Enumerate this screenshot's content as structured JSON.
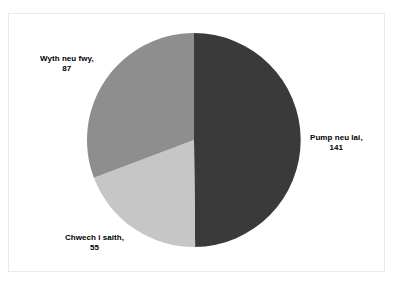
{
  "chart_data": {
    "type": "pie",
    "title": "",
    "subtitle": "",
    "xlabel": "",
    "ylabel": "",
    "legend_position": "none",
    "grid": false,
    "labels_on_slices": true,
    "label_format": "name, value",
    "total": 283,
    "start_angle_deg": 0,
    "direction": "clockwise",
    "categories": [
      "Pump neu lai",
      "Chwech i saith",
      "Wyth neu fwy"
    ],
    "values": [
      141,
      55,
      87
    ],
    "slices": [
      {
        "name": "Pump neu lai",
        "value": 141,
        "label_name": "Pump neu lai,",
        "label_value": "141",
        "color": "#3a3a3a",
        "start_deg": 0,
        "sweep_deg": 179.4,
        "percent": 49.8
      },
      {
        "name": "Chwech i saith",
        "value": 55,
        "label_name": "Chwech i saith,",
        "label_value": "55",
        "color": "#c6c6c6",
        "start_deg": 179.4,
        "sweep_deg": 69.9,
        "percent": 19.4
      },
      {
        "name": "Wyth neu fwy",
        "value": 87,
        "label_name": "Wyth neu fwy,",
        "label_value": "87",
        "color": "#8e8e8e",
        "start_deg": 249.3,
        "sweep_deg": 110.7,
        "percent": 30.7
      }
    ],
    "geometry": {
      "center_x": 194,
      "center_y": 140,
      "radius": 107
    },
    "colors": {
      "slice_dark": "#3a3a3a",
      "slice_medium": "#8e8e8e",
      "slice_light": "#c6c6c6",
      "background": "#ffffff",
      "frame_border": "#e9e9e9",
      "label_text": "#000000"
    }
  }
}
